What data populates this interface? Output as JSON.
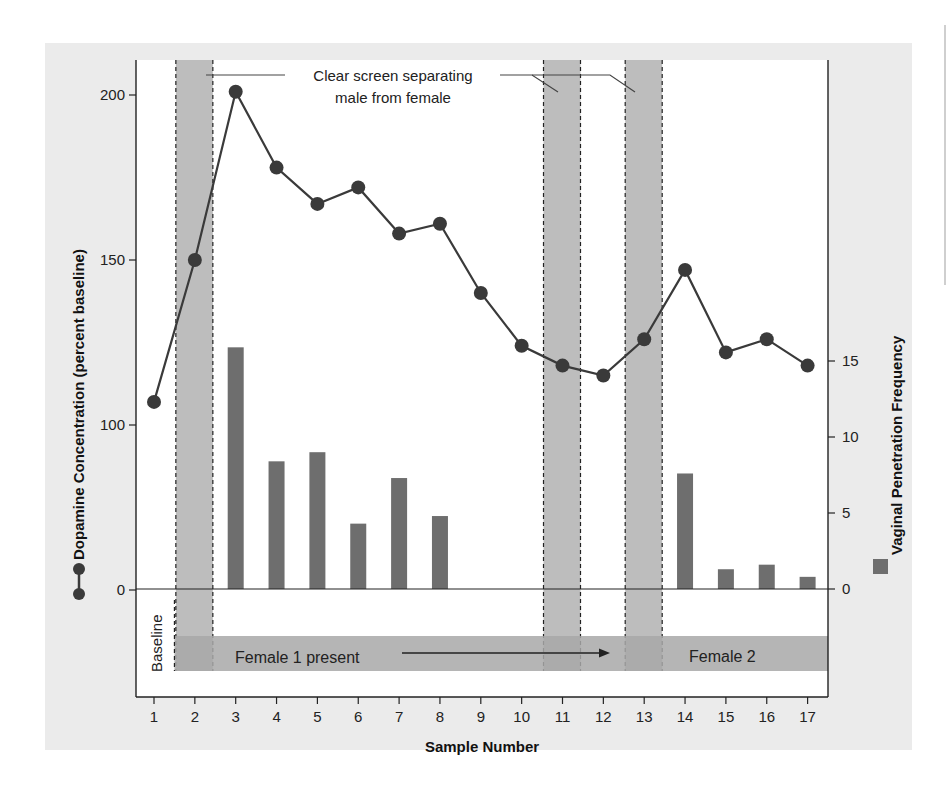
{
  "chart_data": {
    "type": "bar+line",
    "title": "",
    "xlabel": "Sample Number",
    "ylabel_left": "Dopamine Concentration (percent baseline)",
    "ylabel_right": "Vaginal Penetration Frequency",
    "x": [
      1,
      2,
      3,
      4,
      5,
      6,
      7,
      8,
      9,
      10,
      11,
      12,
      13,
      14,
      15,
      16,
      17
    ],
    "left_ticks": [
      0,
      100,
      150,
      200
    ],
    "right_ticks": [
      0,
      5,
      10,
      15
    ],
    "left_axis_note": "Non-linear (broken) scale: 0-100 compressed, 100-200 expanded",
    "ylim_left": [
      -40,
      210
    ],
    "ylim_right": [
      -7,
      18
    ],
    "series": [
      {
        "name": "Dopamine Concentration (percent baseline)",
        "type": "line",
        "marker": "circle",
        "color": "#3a3a3a",
        "values": [
          107,
          150,
          201,
          178,
          167,
          172,
          158,
          161,
          140,
          124,
          118,
          115,
          126,
          147,
          122,
          126,
          118
        ]
      },
      {
        "name": "Vaginal Penetration Frequency",
        "type": "bar",
        "color": "#6e6e6e",
        "values": [
          0,
          0,
          15.9,
          8.4,
          9.0,
          4.3,
          7.3,
          4.8,
          0,
          0,
          0,
          0,
          0,
          7.6,
          1.3,
          1.6,
          0.8
        ]
      }
    ],
    "shaded_samples": [
      2,
      11,
      13
    ],
    "annotations": [
      {
        "text_line1": "Clear screen separating",
        "text_line2": "male from female"
      },
      {
        "text": "Baseline",
        "span": [
          1,
          1
        ]
      },
      {
        "text": "Female 1 present",
        "span": [
          2,
          12
        ],
        "arrow": true
      },
      {
        "text": "Female 2",
        "span": [
          13,
          17
        ]
      }
    ],
    "grid": false,
    "legend_position": "along axis titles"
  },
  "labels": {
    "annotation_line1": "Clear screen separating",
    "annotation_line2": "male from female",
    "baseline": "Baseline",
    "female1": "Female 1 present",
    "female2": "Female 2",
    "xlabel": "Sample Number",
    "ylabel_left": "Dopamine Concentration (percent baseline)",
    "ylabel_right": "Vaginal Penetration Frequency"
  },
  "colors": {
    "line": "#3a3a3a",
    "bar": "#6e6e6e",
    "screen": "#bdbdbd",
    "band": "#a8a8a8",
    "panel": "#ebebeb",
    "plot_bg": "#ffffff"
  }
}
